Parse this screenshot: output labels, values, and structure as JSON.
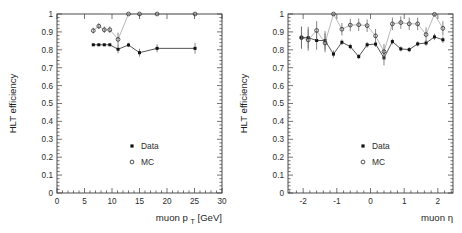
{
  "figure": {
    "panels": [
      "pt-panel",
      "eta-panel"
    ]
  },
  "chart_data": [
    {
      "type": "scatter",
      "panel_id": "pt-panel",
      "title": "",
      "xlabel": "muon p",
      "xlabel_sub": "T",
      "xlabel_unit": "[GeV]",
      "xlabel_full": "muon p_T [GeV]",
      "ylabel": "HLT efficiency",
      "xlim": [
        0,
        30
      ],
      "ylim": [
        0,
        1
      ],
      "xticks": [
        0,
        5,
        10,
        15,
        20,
        25,
        30
      ],
      "xticklabels": [
        "0",
        "5",
        "10",
        "15",
        "20",
        "25",
        "30"
      ],
      "yticks": [
        0,
        0.1,
        0.2,
        0.3,
        0.4,
        0.5,
        0.6,
        0.7,
        0.8,
        0.9,
        1
      ],
      "yticklabels": [
        "0",
        "0.1",
        "0.2",
        "0.3",
        "0.4",
        "0.5",
        "0.6",
        "0.7",
        "0.8",
        "0.9",
        "1"
      ],
      "grid": false,
      "legend_position": "lower-right",
      "series": [
        {
          "name": "Data",
          "marker": "filled-square",
          "color": "#111111",
          "x": [
            6.6,
            7.6,
            8.6,
            9.6,
            11.1,
            13.0,
            15.0,
            18.2,
            25.1
          ],
          "y": [
            0.828,
            0.828,
            0.828,
            0.828,
            0.803,
            0.827,
            0.784,
            0.808,
            0.808
          ],
          "yerr": [
            0.005,
            0.005,
            0.005,
            0.005,
            0.022,
            0.012,
            0.022,
            0.022,
            0.03
          ]
        },
        {
          "name": "MC",
          "marker": "open-circle",
          "color": "#333333",
          "x": [
            6.6,
            7.6,
            8.6,
            9.6,
            11.1,
            13.0,
            15.0,
            18.2,
            25.1
          ],
          "y": [
            0.907,
            0.932,
            0.912,
            0.912,
            0.858,
            1.0,
            1.0,
            1.0,
            1.0
          ],
          "yerr": [
            0.016,
            0.016,
            0.018,
            0.018,
            0.038,
            0.004,
            0.004,
            0.004,
            0.004
          ]
        }
      ]
    },
    {
      "type": "scatter",
      "panel_id": "eta-panel",
      "title": "",
      "xlabel": "muon",
      "xlabel_symbol": "η",
      "xlabel_full": "muon η",
      "ylabel": "HLT efficiency",
      "xlim": [
        -2.45,
        2.45
      ],
      "ylim": [
        0,
        1
      ],
      "xticks": [
        -2,
        -1,
        0,
        1,
        2
      ],
      "xticklabels": [
        "-2",
        "-1",
        "0",
        "1",
        "2"
      ],
      "yticks": [
        0,
        0.1,
        0.2,
        0.3,
        0.4,
        0.5,
        0.6,
        0.7,
        0.8,
        0.9,
        1
      ],
      "yticklabels": [
        "0",
        "0.1",
        "0.2",
        "0.3",
        "0.4",
        "0.5",
        "0.6",
        "0.7",
        "0.8",
        "0.9",
        "1"
      ],
      "grid": false,
      "legend_position": "lower-right",
      "series": [
        {
          "name": "Data",
          "marker": "filled-square",
          "color": "#111111",
          "x": [
            -2.05,
            -1.85,
            -1.6,
            -1.35,
            -1.1,
            -0.85,
            -0.6,
            -0.35,
            -0.1,
            0.15,
            0.4,
            0.65,
            0.9,
            1.15,
            1.4,
            1.65,
            1.9,
            2.15
          ],
          "y": [
            0.868,
            0.868,
            0.852,
            0.852,
            0.776,
            0.842,
            0.818,
            0.762,
            0.828,
            0.832,
            0.755,
            0.846,
            0.805,
            0.801,
            0.833,
            0.838,
            0.872,
            0.856
          ],
          "yerr": [
            0.06,
            0.06,
            0.052,
            0.052,
            0.02,
            0.016,
            0.016,
            0.014,
            0.016,
            0.016,
            0.042,
            0.016,
            0.014,
            0.014,
            0.014,
            0.016,
            0.018,
            0.018
          ]
        },
        {
          "name": "MC",
          "marker": "open-circle",
          "color": "#333333",
          "x": [
            -2.05,
            -1.85,
            -1.6,
            -1.35,
            -1.1,
            -0.85,
            -0.6,
            -0.35,
            -0.1,
            0.15,
            0.4,
            0.65,
            0.9,
            1.15,
            1.4,
            1.65,
            1.9,
            2.15
          ],
          "y": [
            0.868,
            0.855,
            0.908,
            0.838,
            1.0,
            0.915,
            0.938,
            0.94,
            0.935,
            0.878,
            0.79,
            0.945,
            0.952,
            0.945,
            0.945,
            0.885,
            0.998,
            0.92
          ],
          "yerr": [
            0.062,
            0.06,
            0.052,
            0.052,
            0.008,
            0.035,
            0.035,
            0.035,
            0.035,
            0.038,
            0.042,
            0.035,
            0.035,
            0.035,
            0.035,
            0.04,
            0.01,
            0.04
          ]
        }
      ],
      "annotations": []
    }
  ],
  "legend": {
    "entries": [
      {
        "label": "Data",
        "marker": "filled-square"
      },
      {
        "label": "MC",
        "marker": "open-circle"
      }
    ]
  },
  "colors": {
    "axis": "#3a3a3a",
    "data_marker": "#111111",
    "mc_marker": "#333333",
    "error_bar": "#6e6e6e",
    "background": "#ffffff"
  }
}
